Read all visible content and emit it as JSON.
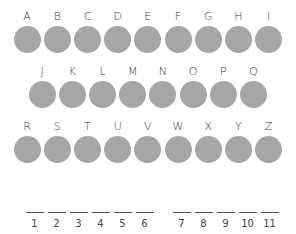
{
  "puzzle": {
    "rows": [
      {
        "letters": [
          "A",
          "B",
          "C",
          "D",
          "E",
          "F",
          "G",
          "H",
          "I"
        ]
      },
      {
        "letters": [
          "J",
          "K",
          "L",
          "M",
          "N",
          "O",
          "P",
          "Q"
        ]
      },
      {
        "letters": [
          "R",
          "S",
          "T",
          "U",
          "V",
          "W",
          "X",
          "Y",
          "Z"
        ]
      }
    ],
    "circle_color": "#a6a6a6",
    "word1": {
      "positions": [
        "1",
        "2",
        "3",
        "4",
        "5",
        "6"
      ]
    },
    "word2": {
      "positions": [
        "7",
        "8",
        "9",
        "10",
        "11"
      ]
    }
  }
}
